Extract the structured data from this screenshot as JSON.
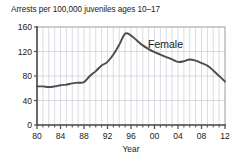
{
  "chart_data": {
    "type": "line",
    "title": "Arrests per 100,000 juveniles ages 10–17",
    "xlabel": "Year",
    "ylabel": "",
    "xlim": [
      1980,
      2012
    ],
    "ylim": [
      0,
      160
    ],
    "grid": true,
    "grid_x_step": 1,
    "grid_y_step": 40,
    "legend_position": "inline-right",
    "y_ticks": [
      0,
      40,
      80,
      120,
      160
    ],
    "y_tick_labels": [
      "0",
      "40",
      "80",
      "120",
      "160"
    ],
    "x_ticks": [
      1980,
      1984,
      1988,
      1992,
      1996,
      2000,
      2004,
      2008,
      2012
    ],
    "x_tick_labels": [
      "80",
      "84",
      "88",
      "92",
      "96",
      "00",
      "04",
      "08",
      "12"
    ],
    "x_minor_ticks": [
      1981,
      1982,
      1983,
      1985,
      1986,
      1987,
      1989,
      1990,
      1991,
      1993,
      1994,
      1995,
      1997,
      1998,
      1999,
      2001,
      2002,
      2003,
      2005,
      2006,
      2007,
      2009,
      2010,
      2011
    ],
    "annotations": [
      {
        "text": "Female",
        "x": 2000,
        "y": 130
      }
    ],
    "series": [
      {
        "name": "Female",
        "color": "#4d4d4d",
        "x": [
          1980,
          1981,
          1982,
          1983,
          1984,
          1985,
          1986,
          1987,
          1988,
          1989,
          1990,
          1991,
          1992,
          1993,
          1994,
          1995,
          1996,
          1997,
          1998,
          1999,
          2000,
          2001,
          2002,
          2003,
          2004,
          2005,
          2006,
          2007,
          2008,
          2009,
          2010,
          2011,
          2012
        ],
        "values": [
          63,
          63,
          62,
          63,
          65,
          66,
          68,
          69,
          70,
          80,
          88,
          97,
          103,
          115,
          131,
          149,
          146,
          138,
          130,
          124,
          119,
          115,
          111,
          107,
          103,
          104,
          107,
          105,
          101,
          97,
          89,
          80,
          71
        ]
      }
    ]
  },
  "colors": {
    "line": "#4d4d4d",
    "grid": "#bfc4cc",
    "axis": "#555555",
    "frame": "#808080",
    "text": "#1a1a1a",
    "background": "#ffffff"
  }
}
